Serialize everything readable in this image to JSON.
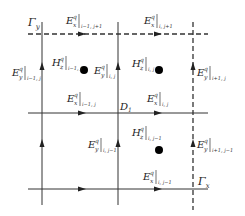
{
  "diagram": {
    "boundaries": {
      "gamma_y": "Γ",
      "gamma_y_sub": "y",
      "gamma_x": "Γ",
      "gamma_x_sub": "x",
      "domain": "D",
      "domain_sub": "1"
    },
    "labels": {
      "ex_top_left": {
        "base": "E",
        "sub": "x",
        "sup": "q",
        "idx": "i−1, j+1"
      },
      "ex_top_right": {
        "base": "E",
        "sub": "x",
        "sup": "q",
        "idx": "i, j+1"
      },
      "ey_left_top": {
        "base": "E",
        "sub": "y",
        "sup": "q",
        "idx": "i−1, j"
      },
      "hz_top_left": {
        "base": "H",
        "sub": "z",
        "sup": "q",
        "idx": "i−1, j"
      },
      "ey_mid_top": {
        "base": "E",
        "sub": "y",
        "sup": "q",
        "idx": "i, j"
      },
      "hz_top_right": {
        "base": "H",
        "sub": "z",
        "sup": "q",
        "idx": "i, j"
      },
      "ey_right_top": {
        "base": "E",
        "sub": "y",
        "sup": "q",
        "idx": "i+1, j"
      },
      "ex_mid_left": {
        "base": "E",
        "sub": "x",
        "sup": "q",
        "idx": "i−1, j"
      },
      "ex_mid_right": {
        "base": "E",
        "sub": "x",
        "sup": "q",
        "idx": "i, j"
      },
      "ey_mid_bot": {
        "base": "E",
        "sub": "y",
        "sup": "q",
        "idx": "i, j−1"
      },
      "hz_bot": {
        "base": "H",
        "sub": "z",
        "sup": "q",
        "idx": "i, j−1"
      },
      "ey_right_bot": {
        "base": "E",
        "sub": "y",
        "sup": "q",
        "idx": "i+1, j−1"
      },
      "ex_bot": {
        "base": "E",
        "sub": "x",
        "sup": "q",
        "idx": "i, j−1"
      }
    },
    "colors": {
      "line": "#333333",
      "text": "#222222",
      "node": "#000000"
    }
  }
}
